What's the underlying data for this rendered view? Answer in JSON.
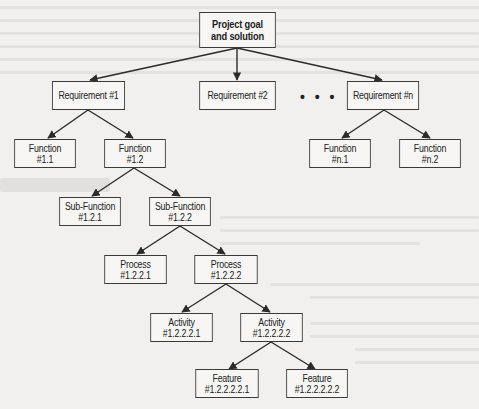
{
  "diagram": {
    "type": "hierarchy-tree",
    "nodes": {
      "root": {
        "line1": "Project goal",
        "line2": "and solution"
      },
      "req1": {
        "line1": "Requirement #1"
      },
      "req2": {
        "line1": "Requirement #2"
      },
      "reqn": {
        "line1": "Requirement #n"
      },
      "f11": {
        "line1": "Function",
        "line2": "#1.1"
      },
      "f12": {
        "line1": "Function",
        "line2": "#1.2"
      },
      "fn1": {
        "line1": "Function",
        "line2": "#n.1"
      },
      "fn2": {
        "line1": "Function",
        "line2": "#n.2"
      },
      "sf121": {
        "line1": "Sub-Function",
        "line2": "#1.2.1"
      },
      "sf122": {
        "line1": "Sub-Function",
        "line2": "#1.2.2"
      },
      "p1221": {
        "line1": "Process",
        "line2": "#1.2.2.1"
      },
      "p1222": {
        "line1": "Process",
        "line2": "#1.2.2.2"
      },
      "a12221": {
        "line1": "Activity",
        "line2": "#1.2.2.2.1"
      },
      "a12222": {
        "line1": "Activity",
        "line2": "#1.2.2.2.2"
      },
      "ft122221": {
        "line1": "Feature",
        "line2": "#1.2.2.2.2.1"
      },
      "ft122222": {
        "line1": "Feature",
        "line2": "#1.2.2.2.2.2"
      }
    },
    "ellipsis": "• • •",
    "edges": [
      [
        "root",
        "req1"
      ],
      [
        "root",
        "req2"
      ],
      [
        "root",
        "reqn"
      ],
      [
        "req1",
        "f11"
      ],
      [
        "req1",
        "f12"
      ],
      [
        "reqn",
        "fn1"
      ],
      [
        "reqn",
        "fn2"
      ],
      [
        "f12",
        "sf121"
      ],
      [
        "f12",
        "sf122"
      ],
      [
        "sf122",
        "p1221"
      ],
      [
        "sf122",
        "p1222"
      ],
      [
        "p1222",
        "a12221"
      ],
      [
        "p1222",
        "a12222"
      ],
      [
        "a12222",
        "ft122221"
      ],
      [
        "a12222",
        "ft122222"
      ]
    ],
    "colors": {
      "line": "#2b2b2b",
      "box_border": "#3a3a3a",
      "box_fill": "#f7f6f4",
      "background": "#f1f0ee"
    }
  }
}
